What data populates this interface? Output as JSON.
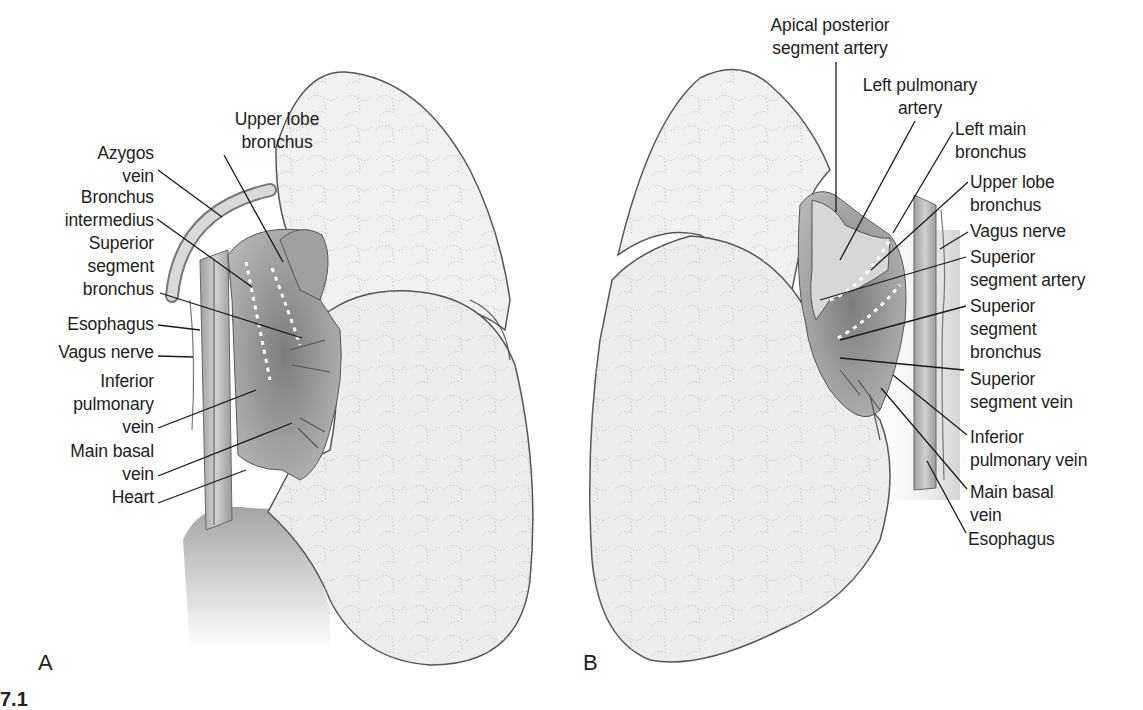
{
  "figure": {
    "panels": [
      {
        "id": "A",
        "letter": "A",
        "labels": [
          {
            "text": "Upper lobe\nbronchus",
            "x": 222,
            "y": 108,
            "w": 110,
            "align": "c",
            "line": [
              [
                224,
                155
              ],
              [
                283,
                262
              ]
            ]
          },
          {
            "text": "Azygos\nvein",
            "x": 50,
            "y": 142,
            "w": 104,
            "align": "r",
            "line": [
              [
                158,
                170
              ],
              [
                222,
                217
              ]
            ]
          },
          {
            "text": "Bronchus\nintermedius",
            "x": 30,
            "y": 186,
            "w": 124,
            "align": "r",
            "line": [
              [
                157,
                219
              ],
              [
                252,
                287
              ]
            ]
          },
          {
            "text": "Superior\nsegment\nbronchus",
            "x": 40,
            "y": 232,
            "w": 114,
            "align": "r",
            "line": [
              [
                160,
                293
              ],
              [
                302,
                338
              ]
            ]
          },
          {
            "text": "Esophagus",
            "x": 30,
            "y": 313,
            "w": 124,
            "align": "r",
            "line": [
              [
                158,
                325
              ],
              [
                200,
                330
              ]
            ]
          },
          {
            "text": "Vagus nerve",
            "x": 20,
            "y": 341,
            "w": 134,
            "align": "r",
            "line": [
              [
                158,
                356
              ],
              [
                193,
                357
              ]
            ]
          },
          {
            "text": "Inferior\npulmonary\nvein",
            "x": 40,
            "y": 370,
            "w": 114,
            "align": "r",
            "line": [
              [
                158,
                428
              ],
              [
                256,
                390
              ]
            ]
          },
          {
            "text": "Main basal\nvein",
            "x": 40,
            "y": 440,
            "w": 114,
            "align": "r",
            "line": [
              [
                158,
                476
              ],
              [
                292,
                423
              ]
            ]
          },
          {
            "text": "Heart",
            "x": 60,
            "y": 486,
            "w": 94,
            "align": "r",
            "line": [
              [
                158,
                503
              ],
              [
                246,
                470
              ]
            ]
          }
        ]
      },
      {
        "id": "B",
        "letter": "B",
        "labels": [
          {
            "text": "Apical posterior\nsegment artery",
            "x": 760,
            "y": 14,
            "w": 140,
            "align": "c",
            "line": [
              [
                836,
                62
              ],
              [
                836,
                212
              ]
            ]
          },
          {
            "text": "Left pulmonary\nartery",
            "x": 850,
            "y": 74,
            "w": 140,
            "align": "c",
            "line": [
              [
                915,
                121
              ],
              [
                840,
                260
              ]
            ]
          },
          {
            "text": "Left main\nbronchus",
            "x": 955,
            "y": 118,
            "w": 120,
            "align": "l",
            "line": [
              [
                953,
                132
              ],
              [
                893,
                233
              ]
            ]
          },
          {
            "text": "Upper lobe\nbronchus",
            "x": 970,
            "y": 171,
            "w": 130,
            "align": "l",
            "line": [
              [
                968,
                182
              ],
              [
                871,
                270
              ]
            ]
          },
          {
            "text": "Vagus nerve",
            "x": 970,
            "y": 220,
            "w": 130,
            "align": "l",
            "line": [
              [
                968,
                232
              ],
              [
                940,
                249
              ]
            ]
          },
          {
            "text": "Superior\nsegment artery",
            "x": 970,
            "y": 246,
            "w": 140,
            "align": "l",
            "line": [
              [
                966,
                257
              ],
              [
                820,
                300
              ]
            ]
          },
          {
            "text": "Superior\nsegment\nbronchus",
            "x": 970,
            "y": 295,
            "w": 120,
            "align": "l",
            "line": [
              [
                966,
                306
              ],
              [
                840,
                340
              ]
            ]
          },
          {
            "text": "Superior\nsegment vein",
            "x": 970,
            "y": 368,
            "w": 130,
            "align": "l",
            "line": [
              [
                964,
                370
              ],
              [
                840,
                358
              ]
            ]
          },
          {
            "text": "Inferior\npulmonary vein",
            "x": 970,
            "y": 426,
            "w": 140,
            "align": "l",
            "line": [
              [
                967,
                435
              ],
              [
                893,
                375
              ]
            ]
          },
          {
            "text": "Main basal\nvein",
            "x": 970,
            "y": 481,
            "w": 120,
            "align": "l",
            "line": [
              [
                967,
                489
              ],
              [
                881,
                388
              ]
            ]
          },
          {
            "text": "Esophagus",
            "x": 968,
            "y": 528,
            "w": 120,
            "align": "l",
            "line": [
              [
                966,
                533
              ],
              [
                927,
                461
              ]
            ]
          }
        ]
      }
    ],
    "panel_letters": {
      "A": "A",
      "B": "B"
    },
    "figure_number_fragment": "7.1"
  },
  "colors": {
    "lung_fill": "#efefef",
    "lung_stroke": "#555555",
    "hilum_dark": "#8a8a8a",
    "hilum_mid": "#a9a9a9",
    "leader_line": "#1a1a1a",
    "text": "#222222"
  }
}
